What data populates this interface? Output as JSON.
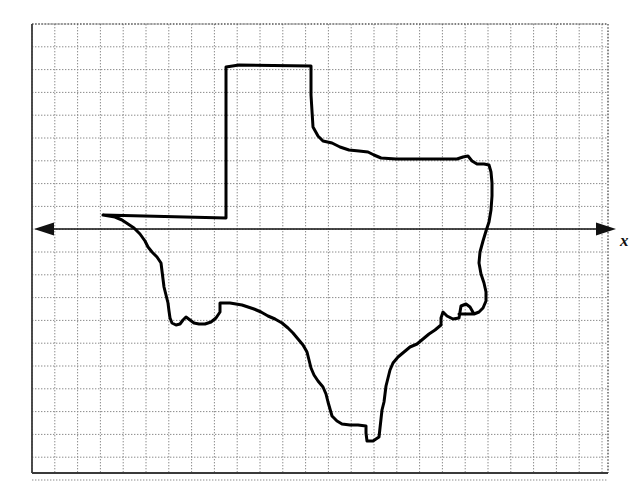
{
  "figure": {
    "background_color": "#ffffff",
    "outline_color": "#000000",
    "outline_width_px": 3,
    "grid": {
      "major_color": "#555555",
      "minor_color": "#8a8a8a",
      "frame_color": "#3a3a3a",
      "left_px": 32,
      "top_px": 24,
      "right_px": 608,
      "bottom_px": 473,
      "cell_size_px": 22.8,
      "columns": 25,
      "rows": 19,
      "style": "dotted",
      "visible": true
    },
    "axis": {
      "name": "x-axis",
      "orientation": "horizontal",
      "y_px": 229,
      "start_x_px": 34,
      "end_x_px": 616,
      "arrow_both_ends": true,
      "color": "#111111",
      "label": "x",
      "label_x_px": 620,
      "label_y_px": 246
    }
  },
  "chart_data": {
    "type": "line",
    "xlabel": "x",
    "ylabel": "",
    "grid": true,
    "legend": null,
    "axis_line_y_px": 229,
    "shape_name": "Texas",
    "closed_path": true,
    "outline_points_px": [
      [
        103,
        215
      ],
      [
        226,
        218
      ],
      [
        226,
        67
      ],
      [
        239,
        65
      ],
      [
        311,
        66
      ],
      [
        311,
        95
      ],
      [
        313,
        127
      ],
      [
        318,
        136
      ],
      [
        323,
        141
      ],
      [
        332,
        143
      ],
      [
        340,
        147
      ],
      [
        349,
        150
      ],
      [
        359,
        151
      ],
      [
        368,
        152
      ],
      [
        374,
        155
      ],
      [
        381,
        158
      ],
      [
        396,
        159
      ],
      [
        410,
        159
      ],
      [
        430,
        159
      ],
      [
        446,
        159
      ],
      [
        457,
        159
      ],
      [
        463,
        157
      ],
      [
        468,
        156
      ],
      [
        472,
        161
      ],
      [
        477,
        164
      ],
      [
        484,
        164
      ],
      [
        489,
        165
      ],
      [
        491,
        172
      ],
      [
        492,
        183
      ],
      [
        492,
        196
      ],
      [
        491,
        210
      ],
      [
        489,
        222
      ],
      [
        486,
        231
      ],
      [
        483,
        241
      ],
      [
        480,
        252
      ],
      [
        479,
        263
      ],
      [
        481,
        274
      ],
      [
        484,
        283
      ],
      [
        486,
        292
      ],
      [
        486,
        301
      ],
      [
        483,
        308
      ],
      [
        479,
        312
      ],
      [
        474,
        314
      ],
      [
        466,
        314
      ],
      [
        459,
        314
      ],
      [
        474,
        314
      ],
      [
        470,
        307
      ],
      [
        466,
        304
      ],
      [
        461,
        306
      ],
      [
        460,
        312
      ],
      [
        459,
        318
      ],
      [
        453,
        319
      ],
      [
        447,
        316
      ],
      [
        443,
        312
      ],
      [
        441,
        318
      ],
      [
        441,
        325
      ],
      [
        435,
        330
      ],
      [
        429,
        334
      ],
      [
        423,
        339
      ],
      [
        417,
        344
      ],
      [
        410,
        347
      ],
      [
        404,
        352
      ],
      [
        398,
        357
      ],
      [
        393,
        363
      ],
      [
        390,
        370
      ],
      [
        388,
        378
      ],
      [
        386,
        386
      ],
      [
        385,
        394
      ],
      [
        384,
        402
      ],
      [
        382,
        410
      ],
      [
        381,
        419
      ],
      [
        380,
        428
      ],
      [
        379,
        437
      ],
      [
        373,
        441
      ],
      [
        367,
        441
      ],
      [
        366,
        433
      ],
      [
        366,
        426
      ],
      [
        358,
        425
      ],
      [
        350,
        425
      ],
      [
        342,
        424
      ],
      [
        337,
        421
      ],
      [
        332,
        416
      ],
      [
        330,
        409
      ],
      [
        328,
        402
      ],
      [
        326,
        394
      ],
      [
        323,
        387
      ],
      [
        318,
        381
      ],
      [
        314,
        375
      ],
      [
        311,
        368
      ],
      [
        309,
        360
      ],
      [
        307,
        352
      ],
      [
        303,
        345
      ],
      [
        298,
        339
      ],
      [
        293,
        333
      ],
      [
        288,
        328
      ],
      [
        282,
        323
      ],
      [
        275,
        319
      ],
      [
        268,
        316
      ],
      [
        261,
        312
      ],
      [
        254,
        309
      ],
      [
        248,
        307
      ],
      [
        242,
        305
      ],
      [
        236,
        304
      ],
      [
        230,
        303
      ],
      [
        224,
        303
      ],
      [
        220,
        303
      ],
      [
        220,
        312
      ],
      [
        216,
        318
      ],
      [
        211,
        322
      ],
      [
        205,
        324
      ],
      [
        199,
        324
      ],
      [
        194,
        323
      ],
      [
        190,
        320
      ],
      [
        186,
        317
      ],
      [
        183,
        320
      ],
      [
        180,
        324
      ],
      [
        176,
        325
      ],
      [
        172,
        323
      ],
      [
        170,
        318
      ],
      [
        169,
        311
      ],
      [
        168,
        303
      ],
      [
        166,
        295
      ],
      [
        164,
        287
      ],
      [
        163,
        279
      ],
      [
        162,
        271
      ],
      [
        161,
        263
      ],
      [
        157,
        257
      ],
      [
        152,
        252
      ],
      [
        148,
        247
      ],
      [
        145,
        241
      ],
      [
        140,
        234
      ],
      [
        134,
        228
      ],
      [
        128,
        224
      ],
      [
        122,
        220
      ],
      [
        115,
        217
      ],
      [
        109,
        216
      ],
      [
        103,
        215
      ]
    ]
  }
}
